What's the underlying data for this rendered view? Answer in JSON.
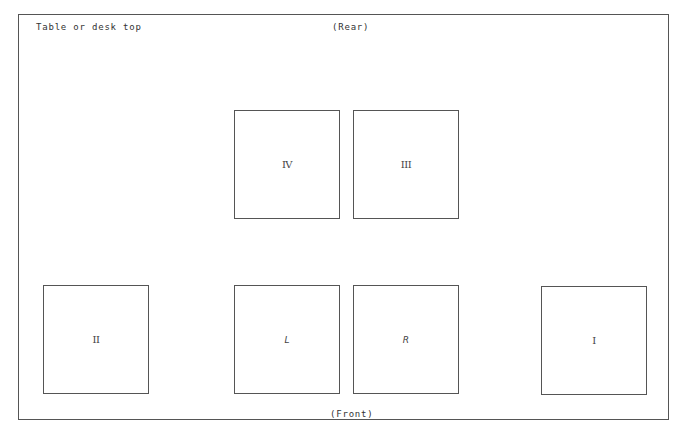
{
  "diagram": {
    "title": "Table or desk top",
    "rear_label": "(Rear)",
    "front_label": "(Front)",
    "boxes": [
      {
        "id": "IV",
        "label": "IV",
        "row": "rear",
        "position": "left-center"
      },
      {
        "id": "III",
        "label": "III",
        "row": "rear",
        "position": "right-center"
      },
      {
        "id": "II",
        "label": "II",
        "row": "front",
        "position": "far-left"
      },
      {
        "id": "L",
        "label": "L",
        "row": "front",
        "position": "left-center"
      },
      {
        "id": "R",
        "label": "R",
        "row": "front",
        "position": "right-center"
      },
      {
        "id": "I",
        "label": "I",
        "row": "front",
        "position": "far-right"
      }
    ],
    "colors": {
      "line": "#555555",
      "text": "#333333",
      "background": "#ffffff"
    }
  }
}
